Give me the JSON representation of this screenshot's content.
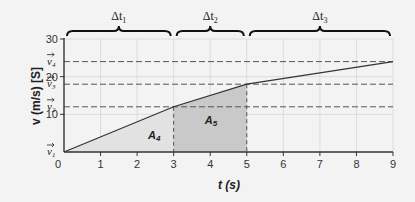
{
  "chart_data": {
    "type": "line",
    "title": "",
    "xlabel": "t (s)",
    "ylabel": "v (m/s) [S]",
    "xlim": [
      0,
      9
    ],
    "ylim": [
      0,
      30
    ],
    "x_ticks": [
      0,
      1,
      2,
      3,
      4,
      5,
      6,
      7,
      8,
      9
    ],
    "y_ticks": [
      10,
      20,
      30
    ],
    "grid": true,
    "series": [
      {
        "name": "velocity",
        "x": [
          0,
          3,
          5,
          9
        ],
        "y": [
          0,
          12,
          18,
          24
        ]
      }
    ],
    "reference_lines": [
      {
        "label": "v1",
        "value": 0
      },
      {
        "label": "v2",
        "value": 12
      },
      {
        "label": "v3",
        "value": 18
      },
      {
        "label": "v4",
        "value": 24
      }
    ],
    "vertical_markers": [
      3,
      5
    ],
    "shaded_areas": [
      {
        "label": "A4",
        "from": 0,
        "to": 3,
        "color": "#e2e2e2"
      },
      {
        "label": "A5",
        "from": 3,
        "to": 5,
        "color": "#c9c9c9"
      }
    ],
    "intervals": [
      {
        "label": "Δt1",
        "from": 0,
        "to": 3
      },
      {
        "label": "Δt2",
        "from": 3,
        "to": 5
      },
      {
        "label": "Δt3",
        "from": 5,
        "to": 9
      }
    ]
  },
  "labels": {
    "x_axis": "t (s)",
    "y_axis": "v (m/s) [S]",
    "y_origin": "0",
    "area_a4": "A",
    "area_a4_sub": "4",
    "area_a5": "A",
    "area_a5_sub": "5",
    "delta": "Δt",
    "interval_subs": [
      "1",
      "2",
      "3"
    ],
    "v_names": [
      "v",
      "v",
      "v",
      "v"
    ],
    "v_subs": [
      "1",
      "2",
      "3",
      "4"
    ]
  },
  "colors": {
    "background": "#f3f3f3",
    "grid": "#d6d6d6",
    "line": "#333333",
    "axis": "#333333",
    "area_a4": "#e2e2e2",
    "area_a5": "#c9c9c9"
  }
}
